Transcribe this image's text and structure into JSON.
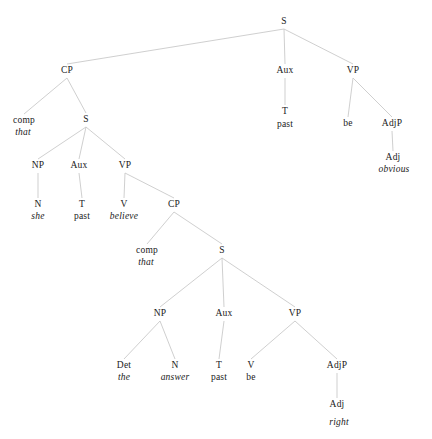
{
  "figure": {
    "type": "syntax-tree",
    "width": 432,
    "height": 439,
    "background": "#ffffff",
    "edge_color": "#c9c9c9",
    "text_color": "#1a1a1a"
  },
  "nodes": [
    {
      "id": "S1",
      "label": "S",
      "style": "cat",
      "x": 284,
      "y": 22
    },
    {
      "id": "CP1",
      "label": "CP",
      "style": "cat",
      "x": 67,
      "y": 71
    },
    {
      "id": "Aux1",
      "label": "Aux",
      "style": "cat",
      "x": 285,
      "y": 71
    },
    {
      "id": "VP1",
      "label": "VP",
      "style": "cat",
      "x": 353,
      "y": 71
    },
    {
      "id": "comp1",
      "label": "comp",
      "style": "cat",
      "x": 24,
      "y": 121
    },
    {
      "id": "that1",
      "label": "that",
      "style": "word-italic",
      "x": 23,
      "y": 133
    },
    {
      "id": "S2",
      "label": "S",
      "style": "cat",
      "x": 86,
      "y": 120
    },
    {
      "id": "T1",
      "label": "T",
      "style": "cat",
      "x": 285,
      "y": 112
    },
    {
      "id": "past1",
      "label": "past",
      "style": "word-roman",
      "x": 285,
      "y": 125
    },
    {
      "id": "be1",
      "label": "be",
      "style": "word-roman",
      "x": 348,
      "y": 124
    },
    {
      "id": "AdjP1",
      "label": "AdjP",
      "style": "cat",
      "x": 392,
      "y": 124
    },
    {
      "id": "Adj1",
      "label": "Adj",
      "style": "cat",
      "x": 393,
      "y": 158
    },
    {
      "id": "obvious1",
      "label": "obvious",
      "style": "word-italic",
      "x": 394,
      "y": 170
    },
    {
      "id": "NP1",
      "label": "NP",
      "style": "cat",
      "x": 38,
      "y": 166
    },
    {
      "id": "Aux2",
      "label": "Aux",
      "style": "cat",
      "x": 79,
      "y": 166
    },
    {
      "id": "VP2",
      "label": "VP",
      "style": "cat",
      "x": 125,
      "y": 166
    },
    {
      "id": "N1",
      "label": "N",
      "style": "cat",
      "x": 38,
      "y": 205
    },
    {
      "id": "she1",
      "label": "she",
      "style": "word-italic",
      "x": 38,
      "y": 217
    },
    {
      "id": "T2",
      "label": "T",
      "style": "cat",
      "x": 82,
      "y": 205
    },
    {
      "id": "past2",
      "label": "past",
      "style": "word-roman",
      "x": 82,
      "y": 217
    },
    {
      "id": "V1",
      "label": "V",
      "style": "cat",
      "x": 124,
      "y": 205
    },
    {
      "id": "believe1",
      "label": "believe",
      "style": "word-italic",
      "x": 124,
      "y": 217
    },
    {
      "id": "CP2",
      "label": "CP",
      "style": "cat",
      "x": 174,
      "y": 205
    },
    {
      "id": "comp2",
      "label": "comp",
      "style": "cat",
      "x": 147,
      "y": 251
    },
    {
      "id": "that2",
      "label": "that",
      "style": "word-italic",
      "x": 146,
      "y": 263
    },
    {
      "id": "S3",
      "label": "S",
      "style": "cat",
      "x": 222,
      "y": 251
    },
    {
      "id": "NP2",
      "label": "NP",
      "style": "cat",
      "x": 160,
      "y": 314
    },
    {
      "id": "Aux3",
      "label": "Aux",
      "style": "cat",
      "x": 224,
      "y": 314
    },
    {
      "id": "VP3",
      "label": "VP",
      "style": "cat",
      "x": 295,
      "y": 314
    },
    {
      "id": "Det1",
      "label": "Det",
      "style": "cat",
      "x": 124,
      "y": 366
    },
    {
      "id": "the1",
      "label": "the",
      "style": "word-italic",
      "x": 124,
      "y": 378
    },
    {
      "id": "N2",
      "label": "N",
      "style": "cat",
      "x": 175,
      "y": 366
    },
    {
      "id": "answer1",
      "label": "answer",
      "style": "word-italic",
      "x": 175,
      "y": 378
    },
    {
      "id": "T3",
      "label": "T",
      "style": "cat",
      "x": 219,
      "y": 366
    },
    {
      "id": "past3",
      "label": "past",
      "style": "word-roman",
      "x": 219,
      "y": 378
    },
    {
      "id": "V2",
      "label": "V",
      "style": "cat",
      "x": 251,
      "y": 366
    },
    {
      "id": "be2",
      "label": "be",
      "style": "word-roman",
      "x": 251,
      "y": 378
    },
    {
      "id": "AdjP2",
      "label": "AdjP",
      "style": "cat",
      "x": 337,
      "y": 366
    },
    {
      "id": "Adj2",
      "label": "Adj",
      "style": "cat",
      "x": 337,
      "y": 405
    },
    {
      "id": "right1",
      "label": "right",
      "style": "word-italic",
      "x": 339,
      "y": 423
    }
  ],
  "edges": [
    {
      "from": "S1",
      "to": "CP1"
    },
    {
      "from": "S1",
      "to": "Aux1"
    },
    {
      "from": "S1",
      "to": "VP1"
    },
    {
      "from": "Aux1",
      "to": "T1"
    },
    {
      "from": "VP1",
      "to": "be1"
    },
    {
      "from": "VP1",
      "to": "AdjP1"
    },
    {
      "from": "AdjP1",
      "to": "Adj1"
    },
    {
      "from": "CP1",
      "to": "comp1"
    },
    {
      "from": "CP1",
      "to": "S2"
    },
    {
      "from": "S2",
      "to": "NP1"
    },
    {
      "from": "S2",
      "to": "Aux2"
    },
    {
      "from": "S2",
      "to": "VP2"
    },
    {
      "from": "NP1",
      "to": "N1"
    },
    {
      "from": "Aux2",
      "to": "T2"
    },
    {
      "from": "VP2",
      "to": "V1"
    },
    {
      "from": "VP2",
      "to": "CP2"
    },
    {
      "from": "CP2",
      "to": "comp2"
    },
    {
      "from": "CP2",
      "to": "S3"
    },
    {
      "from": "S3",
      "to": "NP2"
    },
    {
      "from": "S3",
      "to": "Aux3"
    },
    {
      "from": "S3",
      "to": "VP3"
    },
    {
      "from": "NP2",
      "to": "Det1"
    },
    {
      "from": "NP2",
      "to": "N2"
    },
    {
      "from": "Aux3",
      "to": "T3"
    },
    {
      "from": "VP3",
      "to": "V2"
    },
    {
      "from": "VP3",
      "to": "AdjP2"
    },
    {
      "from": "AdjP2",
      "to": "Adj2"
    }
  ]
}
